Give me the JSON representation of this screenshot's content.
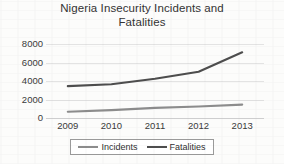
{
  "chart_data": {
    "type": "line",
    "title": "Nigeria Insecurity Incidents and Fatalities",
    "title_lines": [
      "Nigeria Insecurity Incidents and",
      "Fatalities"
    ],
    "xlabel": "",
    "ylabel": "",
    "categories": [
      "2009",
      "2010",
      "2011",
      "2012",
      "2013"
    ],
    "x": [
      2009,
      2010,
      2011,
      2012,
      2013
    ],
    "series": [
      {
        "name": "Incidents",
        "values": [
          670,
          850,
          1100,
          1250,
          1450
        ],
        "color": "#8c8c8c"
      },
      {
        "name": "Fatalities",
        "values": [
          3450,
          3650,
          4250,
          5000,
          7100
        ],
        "color": "#4d4d4d"
      }
    ],
    "ylim": [
      0,
      8000
    ],
    "yticks": [
      0,
      2000,
      4000,
      6000,
      8000
    ],
    "ytick_labels": [
      "0",
      "2000",
      "4000",
      "6000",
      "8000"
    ],
    "grid": true,
    "grid_color": "#e3e3e3",
    "legend_position": "bottom",
    "legend_entries": [
      "Incidents",
      "Fatalities"
    ],
    "background_color": "#fcfcfb"
  }
}
